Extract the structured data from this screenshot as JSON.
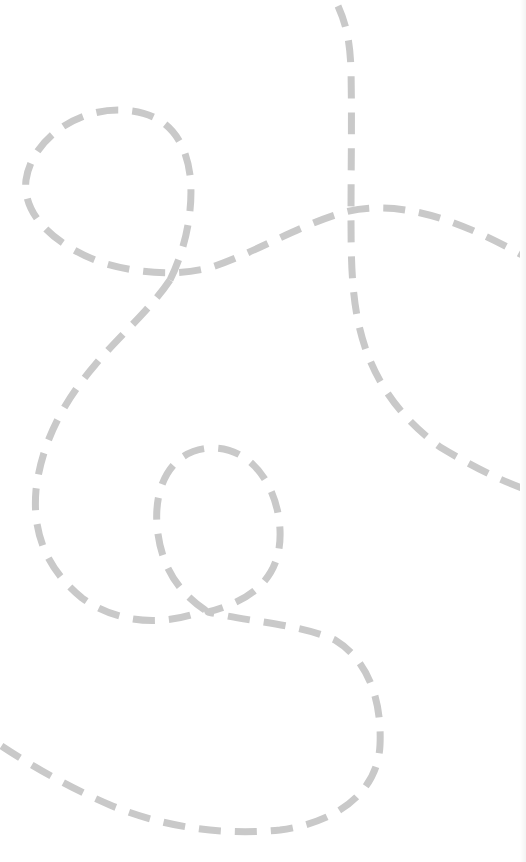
{
  "background": {
    "color": "#ffffff",
    "edge_shade": "#f3f3f3"
  },
  "decoration": {
    "stroke_color": "#c9c9c9",
    "stroke_width": 7,
    "dash_pattern": "22 14",
    "paths": [
      {
        "name": "vertical-curve",
        "d": "M338,6 C346,24 350,40 351,70 C352,120 351,170 351,215 C351,270 352,310 366,350 C382,395 410,425 440,447 C470,465 495,478 522,488"
      },
      {
        "name": "top-left-loop-arc",
        "d": "M170,280 C185,250 194,210 190,175 C184,130 158,110 118,110 C75,110 32,140 26,180 C22,215 55,245 100,262 C140,275 185,276 215,266 C260,250 300,225 345,212 C395,200 450,215 522,255"
      },
      {
        "name": "descending-swirl",
        "d": "M170,280 C150,310 120,335 95,365 C65,400 42,440 36,490 C32,535 48,570 82,598 C115,622 160,628 205,610 C178,592 160,565 157,525 C154,485 172,450 210,448 C250,446 278,485 280,530 C282,575 255,600 208,612 C250,622 300,624 335,640 C368,660 382,700 380,745 C378,790 340,822 280,830 C220,836 160,826 110,805 C70,788 30,765 0,745"
      }
    ]
  }
}
